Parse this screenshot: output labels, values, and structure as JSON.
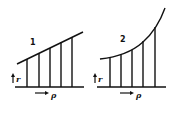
{
  "figures": [
    {
      "id": "1",
      "label": "1",
      "description": "linear profile",
      "vertical_axis_label": "r",
      "horizontal_axis_label": "ρ"
    },
    {
      "id": "2",
      "label": "2",
      "description": "exponentially rising profile",
      "vertical_axis_label": "r",
      "horizontal_axis_label": "ρ"
    }
  ],
  "colors": {
    "ink": "#111111",
    "background": "#ffffff"
  }
}
